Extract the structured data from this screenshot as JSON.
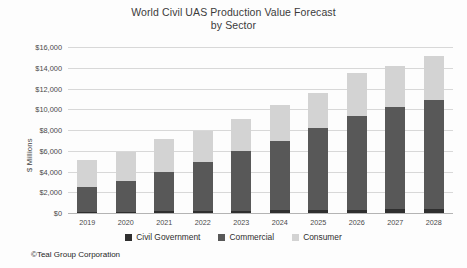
{
  "chart_data": {
    "type": "bar",
    "subtype": "stacked-column",
    "title": "World Civil UAS Production Value Forecast",
    "title_line2": "by Sector",
    "xlabel": "",
    "ylabel": "$ Millions",
    "categories": [
      "2019",
      "2020",
      "2021",
      "2022",
      "2023",
      "2024",
      "2025",
      "2026",
      "2027",
      "2028"
    ],
    "series": [
      {
        "name": "Civil Government",
        "color": "#2f2f2f",
        "values": [
          200,
          230,
          270,
          300,
          330,
          360,
          400,
          430,
          460,
          500
        ]
      },
      {
        "name": "Commercial",
        "color": "#585858",
        "values": [
          2400,
          3000,
          3800,
          4700,
          5700,
          6700,
          7900,
          9000,
          9900,
          10500
        ]
      },
      {
        "name": "Consumer",
        "color": "#d3d3d3",
        "values": [
          2600,
          2770,
          3130,
          3000,
          3170,
          3440,
          3400,
          4170,
          3940,
          4200
        ]
      }
    ],
    "totals": [
      5200,
      6000,
      7200,
      8000,
      9200,
      10500,
      11700,
      13600,
      14300,
      15200
    ],
    "ylim": [
      0,
      16000
    ],
    "ytick_values": [
      0,
      2000,
      4000,
      6000,
      8000,
      10000,
      12000,
      14000,
      16000
    ],
    "ytick_labels": [
      "$0",
      "$2,000",
      "$4,000",
      "$6,000",
      "$8,000",
      "$10,000",
      "$12,000",
      "$14,000",
      "$16,000"
    ],
    "grid": true,
    "legend_position": "bottom"
  },
  "footer": {
    "credit": "©Teal Group Corporation"
  }
}
